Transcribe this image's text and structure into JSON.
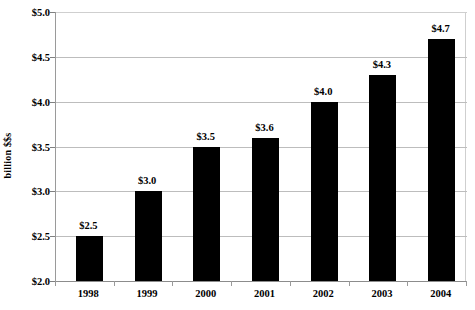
{
  "chart_data": {
    "type": "bar",
    "title": "",
    "subtitle": "",
    "xlabel": "",
    "ylabel": "billion $$s",
    "categories": [
      "1998",
      "1999",
      "2000",
      "2001",
      "2002",
      "2003",
      "2004"
    ],
    "values": [
      2.5,
      3.0,
      3.5,
      3.6,
      4.0,
      4.3,
      4.7
    ],
    "data_labels": [
      "$2.5",
      "$3.0",
      "$3.5",
      "$3.6",
      "$4.0",
      "$4.3",
      "$4.7"
    ],
    "ylim": [
      2.0,
      5.0
    ],
    "ytick_values": [
      5.0,
      4.5,
      4.0,
      3.5,
      3.0,
      2.5,
      2.0
    ],
    "ytick_labels": [
      "$5.0",
      "$4.5",
      "$4.0",
      "$3.5",
      "$3.0",
      "$2.5",
      "$2.0"
    ],
    "grid": true,
    "legend": false,
    "legend_position": "none",
    "series": [
      {
        "name": "",
        "values": [
          2.5,
          3.0,
          3.5,
          3.6,
          4.0,
          4.3,
          4.7
        ],
        "color": "#000000"
      }
    ],
    "colors": {
      "bar": "#000000",
      "gridline": "#bdbdbd",
      "axis": "#8c8c8c",
      "background": "#ffffff",
      "text": "#000000"
    }
  }
}
